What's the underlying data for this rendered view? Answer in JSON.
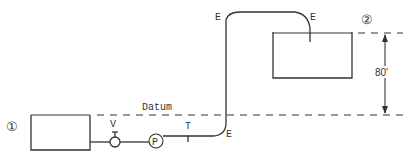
{
  "diagram": {
    "type": "pump-pipeline-schematic",
    "reservoirs": [
      {
        "id": "reservoir-1",
        "marker": "①"
      },
      {
        "id": "reservoir-2",
        "marker": "②"
      }
    ],
    "labels": {
      "datum": "Datum",
      "valve": "V",
      "pump": "P",
      "tee": "T",
      "elbow": "E",
      "elevation_difference": "80'"
    },
    "elbows": [
      "E",
      "E",
      "E"
    ],
    "colors": {
      "line": "#333333",
      "background": "#ffffff"
    }
  }
}
